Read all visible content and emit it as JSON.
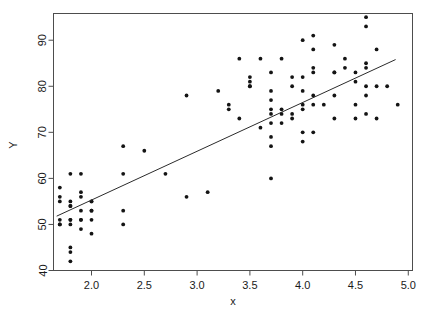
{
  "chart_data": {
    "type": "scatter",
    "title": "",
    "xlabel": "x",
    "ylabel": "Y",
    "xlim": [
      1.64,
      5.04
    ],
    "ylim": [
      40.0,
      95.8
    ],
    "grid": false,
    "legend": "none",
    "xticks": [
      "2.0",
      "2.5",
      "3.0",
      "3.5",
      "4.0",
      "4.5",
      "5.0"
    ],
    "xtick_values": [
      2.0,
      2.5,
      3.0,
      3.5,
      4.0,
      4.5,
      5.0
    ],
    "yticks": [
      "40",
      "50",
      "60",
      "70",
      "80",
      "90"
    ],
    "ytick_values": [
      40,
      50,
      60,
      70,
      80,
      90
    ],
    "series": [
      {
        "name": "observations",
        "marker": "filled-circle",
        "color": "#141414",
        "x": [
          1.7,
          1.7,
          1.7,
          1.7,
          1.7,
          1.7,
          1.8,
          1.8,
          1.8,
          1.8,
          1.8,
          1.8,
          1.8,
          1.8,
          1.8,
          1.8,
          1.9,
          1.9,
          1.9,
          1.9,
          1.9,
          1.9,
          1.9,
          2.0,
          2.0,
          2.0,
          2.0,
          2.0,
          2.0,
          2.3,
          2.3,
          2.3,
          2.3,
          2.5,
          2.7,
          2.9,
          2.9,
          3.1,
          3.2,
          3.3,
          3.3,
          3.4,
          3.4,
          3.5,
          3.5,
          3.5,
          3.5,
          3.6,
          3.6,
          3.7,
          3.7,
          3.7,
          3.7,
          3.7,
          3.7,
          3.7,
          3.7,
          3.7,
          3.8,
          3.8,
          3.8,
          3.8,
          3.9,
          3.9,
          3.9,
          3.9,
          4.0,
          4.0,
          4.0,
          4.0,
          4.0,
          4.0,
          4.0,
          4.1,
          4.1,
          4.1,
          4.1,
          4.1,
          4.1,
          4.1,
          4.2,
          4.3,
          4.3,
          4.3,
          4.3,
          4.3,
          4.4,
          4.4,
          4.5,
          4.5,
          4.5,
          4.5,
          4.6,
          4.6,
          4.6,
          4.6,
          4.6,
          4.6,
          4.6,
          4.7,
          4.7,
          4.7,
          4.8,
          4.9
        ],
        "y": [
          58,
          56,
          55,
          51,
          50,
          50,
          61,
          55,
          54,
          54,
          51,
          51,
          50,
          45,
          44,
          42,
          61,
          57,
          56,
          53,
          51,
          51,
          49,
          55,
          55,
          53,
          53,
          51,
          48,
          67,
          53,
          50,
          61,
          66,
          61,
          78,
          56,
          57,
          79,
          76,
          75,
          86,
          73,
          82,
          81,
          80,
          80,
          86,
          71,
          83,
          79,
          77,
          75,
          74,
          72,
          69,
          67,
          60,
          86,
          75,
          74,
          72,
          82,
          80,
          74,
          73,
          90,
          82,
          79,
          76,
          75,
          70,
          68,
          91,
          88,
          84,
          83,
          78,
          76,
          70,
          76,
          89,
          83,
          83,
          78,
          73,
          86,
          84,
          83,
          81,
          76,
          73,
          95,
          93,
          85,
          84,
          80,
          78,
          74,
          88,
          80,
          73,
          80,
          76
        ]
      }
    ],
    "fit_line": {
      "name": "least-squares-fit",
      "x1": 1.67,
      "y1": 51.8,
      "x2": 4.88,
      "y2": 85.8
    }
  }
}
